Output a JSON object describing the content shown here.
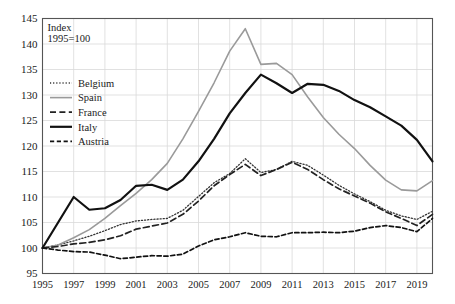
{
  "chart_data": {
    "type": "line",
    "title": "",
    "subtitle": "",
    "annotation_lines": [
      "Index",
      "1995=100"
    ],
    "xlabel": "",
    "ylabel": "",
    "xlim": [
      1995,
      2020
    ],
    "ylim": [
      95,
      145
    ],
    "ytick_step": 5,
    "yticks": [
      95,
      100,
      105,
      110,
      115,
      120,
      125,
      130,
      135,
      140,
      145
    ],
    "xticks": [
      1995,
      1997,
      1999,
      2001,
      2003,
      2005,
      2007,
      2009,
      2011,
      2013,
      2015,
      2017,
      2019
    ],
    "x": [
      1995,
      1996,
      1997,
      1998,
      1999,
      2000,
      2001,
      2002,
      2003,
      2004,
      2005,
      2006,
      2007,
      2008,
      2009,
      2010,
      2011,
      2012,
      2013,
      2014,
      2015,
      2016,
      2017,
      2018,
      2019,
      2020
    ],
    "grid": true,
    "legend_position": "upper-left-inside",
    "series": [
      {
        "name": "Belgium",
        "style": "dotted",
        "color": "#333333",
        "width": 1.3,
        "values": [
          100.0,
          100.6,
          101.4,
          102.3,
          103.4,
          104.6,
          105.3,
          105.6,
          105.8,
          107.4,
          110.1,
          112.8,
          114.6,
          117.5,
          114.8,
          115.4,
          117.0,
          116.2,
          114.3,
          112.3,
          110.6,
          109.1,
          107.4,
          106.3,
          105.6,
          107.2
        ]
      },
      {
        "name": "Spain",
        "style": "solid",
        "color": "#9a9a9a",
        "width": 1.6,
        "values": [
          100.0,
          100.6,
          102.0,
          103.6,
          105.8,
          108.3,
          110.7,
          113.4,
          116.6,
          121.4,
          126.8,
          132.4,
          138.6,
          143.0,
          136.0,
          136.2,
          134.0,
          129.6,
          125.6,
          122.3,
          119.5,
          116.2,
          113.3,
          111.4,
          111.2,
          113.2
        ]
      },
      {
        "name": "France",
        "style": "dashed",
        "color": "#222222",
        "width": 1.7,
        "values": [
          100.0,
          100.3,
          100.8,
          101.1,
          101.6,
          102.4,
          103.7,
          104.3,
          104.9,
          106.6,
          109.2,
          112.2,
          114.4,
          116.4,
          114.2,
          115.4,
          116.8,
          115.4,
          113.4,
          111.6,
          110.2,
          108.8,
          107.1,
          105.8,
          104.4,
          106.6
        ]
      },
      {
        "name": "Italy",
        "style": "solid",
        "color": "#111111",
        "width": 2.2,
        "values": [
          100.0,
          105.0,
          110.0,
          107.5,
          107.8,
          109.4,
          112.2,
          112.4,
          111.4,
          113.4,
          117.0,
          121.4,
          126.4,
          130.4,
          134.0,
          132.3,
          130.4,
          132.2,
          132.0,
          130.8,
          129.0,
          127.6,
          125.8,
          124.0,
          121.2,
          117.0
        ]
      },
      {
        "name": "Austria",
        "style": "dashdot",
        "color": "#111111",
        "width": 1.7,
        "values": [
          100.0,
          99.6,
          99.3,
          99.2,
          98.6,
          97.9,
          98.2,
          98.5,
          98.4,
          98.8,
          100.4,
          101.6,
          102.2,
          103.0,
          102.3,
          102.2,
          103.0,
          103.0,
          103.1,
          103.0,
          103.3,
          104.0,
          104.4,
          104.0,
          103.2,
          105.8
        ]
      }
    ]
  },
  "legend": {
    "items": [
      {
        "label": "Belgium"
      },
      {
        "label": "Spain"
      },
      {
        "label": "France"
      },
      {
        "label": "Italy"
      },
      {
        "label": "Austria"
      }
    ]
  },
  "colors": {
    "axis": "#555555",
    "grid": "#d9d9d9",
    "background": "#ffffff",
    "text": "#1a1a1a"
  }
}
